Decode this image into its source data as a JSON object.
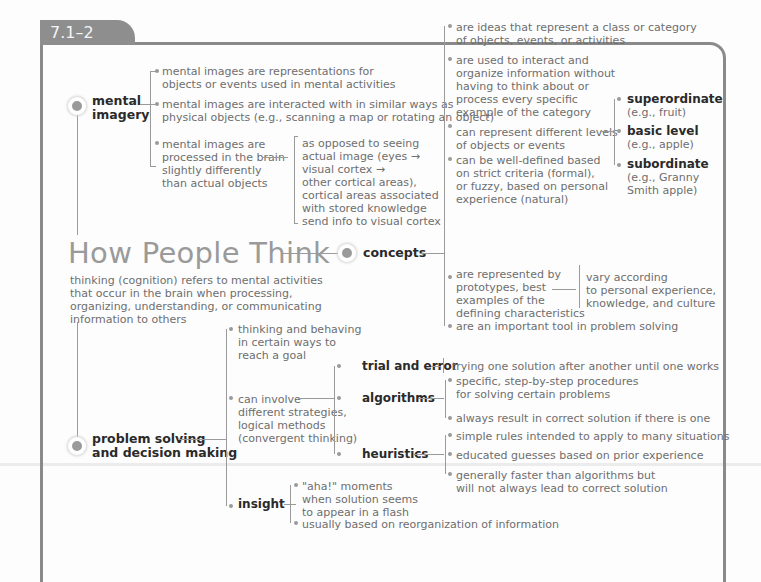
{
  "header": {
    "section_label": "7.1–2"
  },
  "central": {
    "title": "How People Think",
    "definition": [
      "thinking (cognition) refers to mental activities",
      "that occur in the brain when processing,",
      "organizing, understanding, or communicating",
      "information to others"
    ]
  },
  "mental_imagery": {
    "label_line1": "mental",
    "label_line2": "imagery",
    "items": [
      [
        "mental images are representations for",
        "objects or events used in mental activities"
      ],
      [
        "mental images are interacted with in similar ways as",
        "physical objects (e.g., scanning a map or rotating an object)"
      ],
      [
        "mental images are",
        "processed in the brain",
        "slightly differently",
        "than actual objects"
      ]
    ],
    "detail": [
      "as opposed to seeing",
      "actual image (eyes →",
      "visual cortex →",
      "other cortical areas),",
      "cortical areas associated",
      "with stored knowledge",
      "send info to visual cortex"
    ]
  },
  "concepts": {
    "label": "concepts",
    "items": [
      [
        "are ideas that represent a class or category",
        "of objects, events, or activities"
      ],
      [
        "are used to interact and",
        "organize information without",
        "having to think about or",
        "process every specific",
        "example of the category"
      ],
      [
        "can represent different levels",
        "of objects or events"
      ],
      [
        "can be well-defined based",
        "on strict criteria (formal),",
        "or fuzzy, based on personal",
        "experience (natural)"
      ],
      [
        "are represented by",
        "prototypes, best",
        "examples of the",
        "defining characteristics"
      ],
      [
        "are an important tool in problem solving"
      ]
    ],
    "levels": [
      {
        "name": "superordinate",
        "example": [
          "(e.g., fruit)"
        ]
      },
      {
        "name": "basic level",
        "example": [
          "(e.g., apple)"
        ]
      },
      {
        "name": "subordinate",
        "example": [
          "(e.g., Granny",
          "Smith apple)"
        ]
      }
    ],
    "prototype_detail": [
      "vary according",
      "to personal experience,",
      "knowledge, and culture"
    ]
  },
  "problem_solving": {
    "label_line1": "problem solving",
    "label_line2": "and decision making",
    "items": [
      [
        "thinking and behaving",
        "in certain ways to",
        "reach a goal"
      ],
      [
        "can involve",
        "different strategies,",
        "logical methods",
        "(convergent thinking)"
      ]
    ],
    "strategies": [
      {
        "name": "trial and error",
        "details": [
          [
            "trying one solution after another until one works"
          ]
        ]
      },
      {
        "name": "algorithms",
        "details": [
          [
            "specific, step-by-step procedures",
            "for solving certain problems"
          ],
          [
            "always result in correct solution if there is one"
          ]
        ]
      },
      {
        "name": "heuristics",
        "details": [
          [
            "simple rules intended to apply to many situations"
          ],
          [
            "educated guesses based on prior experience"
          ],
          [
            "generally faster than algorithms but",
            "will not always lead to correct solution"
          ]
        ]
      }
    ],
    "insight": {
      "name": "insight",
      "details": [
        [
          "\"aha!\" moments",
          "when solution seems",
          "to appear in a flash"
        ],
        [
          "usually based on reorganization of information"
        ]
      ]
    }
  },
  "colors": {
    "frame": "#8a8a8a",
    "tab": "#8e8e8e",
    "node": "#9a9a9a",
    "title": "#9a9a9a",
    "bold_text": "#2a2a2a",
    "body_text": "#6e6e6e"
  }
}
